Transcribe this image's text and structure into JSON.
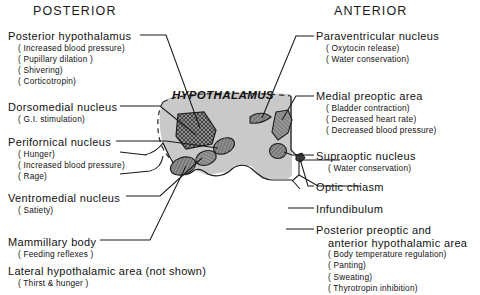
{
  "headers": {
    "left": "POSTERIOR",
    "right": "ANTERIOR"
  },
  "diagram": {
    "region_label": "HYPOTHALAMUS",
    "fill_color": "#c9c9c9",
    "nucleus_color": "#8a8a8a",
    "outline_color": "#1a1a1a"
  },
  "left_labels": [
    {
      "name": "Posterior  hypothalamus",
      "functions": [
        "( Increased   blood   pressure)",
        "( Pupillary   dilation )",
        "( Shivering)",
        "( Corticotropin)"
      ]
    },
    {
      "name": "Dorsomedial  nucleus",
      "functions": [
        "( G.I. stimulation)"
      ]
    },
    {
      "name": "Perifornical  nucleus",
      "functions": [
        "( Hunger)",
        "( Increased  blood  pressure)",
        "( Rage)"
      ]
    },
    {
      "name": "Ventromedial  nucleus",
      "functions": [
        "( Satiety)"
      ]
    },
    {
      "name": "Mammillary  body",
      "functions": [
        "( Feeding  reflexes )"
      ]
    },
    {
      "name": "Lateral  hypothalamic  area (not shown)",
      "functions": [
        "( Thirst & hunger )"
      ]
    }
  ],
  "right_labels": [
    {
      "name": "Paraventricular  nucleus",
      "functions": [
        "( Oxytocin   release)",
        "( Water   conservation)"
      ]
    },
    {
      "name": "Medial   preoptic  area",
      "functions": [
        "( Bladder   contraction)",
        "( Decreased   heart  rate)",
        "( Decreased   blood  pressure)"
      ]
    },
    {
      "name": "Supraoptic  nucleus",
      "functions": [
        "( Water   conservation)"
      ]
    },
    {
      "name": "Optic  chiasm",
      "functions": []
    },
    {
      "name": "Infundibulum",
      "functions": []
    },
    {
      "name": "Posterior  preoptic  and",
      "name_cont": "anterior  hypothalamic  area",
      "functions": [
        "( Body  temperature  regulation)",
        "( Panting)",
        "( Sweating)",
        "( Thyrotropin  inhibition)"
      ]
    }
  ]
}
